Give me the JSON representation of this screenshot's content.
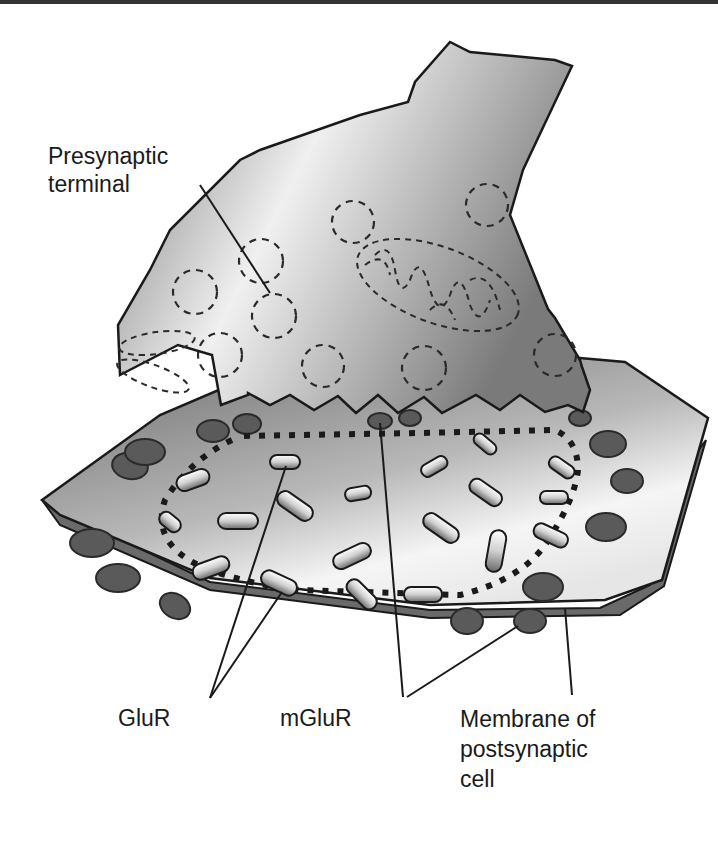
{
  "figure": {
    "labels": {
      "presynaptic_line1": "Presynaptic",
      "presynaptic_line2": "terminal",
      "glur": "GluR",
      "mglur": "mGluR",
      "membrane_line1": "Membrane of",
      "membrane_line2": "postsynaptic",
      "membrane_line3": "cell"
    },
    "colors": {
      "outline": "#1a1a1a",
      "fill_light": "#f2f2f2",
      "fill_mid": "#9a9a9a",
      "fill_dark": "#5e5e5e",
      "receptor_dark": "#5a5a5a"
    }
  }
}
